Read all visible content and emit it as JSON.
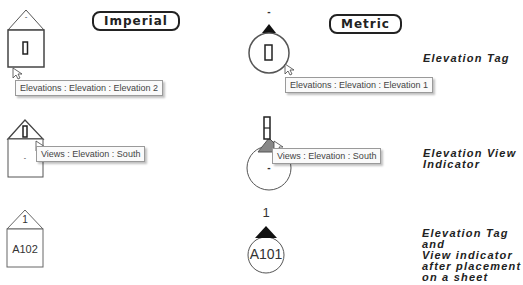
{
  "headers": {
    "imperial": "Imperial",
    "metric": "Metric"
  },
  "rows": [
    {
      "caption_lines": [
        "Elevation Tag"
      ],
      "imperial": {
        "top_label": "-",
        "tooltip": "Elevations : Elevation : Elevation 2"
      },
      "metric": {
        "top_label": "-",
        "tooltip": "Elevations : Elevation : Elevation 1"
      }
    },
    {
      "caption_lines": [
        "Elevation View",
        "Indicator"
      ],
      "imperial": {
        "center_label": "-",
        "tooltip": "Views : Elevation : South"
      },
      "metric": {
        "center_label": "-",
        "tooltip": "Views : Elevation : South"
      }
    },
    {
      "caption_lines": [
        "Elevation Tag and",
        "View indicator",
        "after placement",
        "on a sheet"
      ],
      "imperial": {
        "top_label": "1",
        "sheet_label": "A102"
      },
      "metric": {
        "top_label": "1",
        "sheet_label": "A101"
      }
    }
  ],
  "icons": {
    "cursor": "arrow-cursor-icon",
    "view_marker": "view-marker-rectangle-icon"
  }
}
